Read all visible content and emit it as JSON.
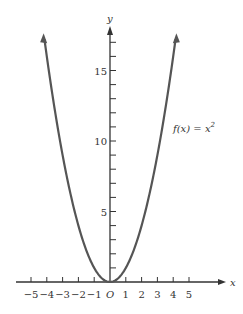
{
  "chart_data": {
    "type": "line",
    "title": "",
    "function_label": "f(x) = x^2",
    "xlabel": "x",
    "ylabel": "y",
    "origin_label": "O",
    "x_ticks": [
      -5,
      -4,
      -3,
      -2,
      -1,
      1,
      2,
      3,
      4,
      5
    ],
    "x_tick_labels": [
      "−5",
      "−4",
      "−3",
      "−2",
      "−1",
      "1",
      "2",
      "3",
      "4",
      "5"
    ],
    "y_tick_labels": [
      "5",
      "10",
      "15"
    ],
    "y_ticks": [
      5,
      10,
      15
    ],
    "xlim": [
      -5.5,
      6
    ],
    "ylim": [
      0,
      18
    ],
    "series": [
      {
        "name": "f(x) = x^2",
        "x": [
          -4.2,
          -4,
          -3,
          -2,
          -1,
          0,
          1,
          2,
          3,
          4,
          4.2
        ],
        "y": [
          17.64,
          16,
          9,
          4,
          1,
          0,
          1,
          4,
          9,
          16,
          17.64
        ]
      }
    ],
    "grid": false,
    "colors": {
      "curve": "#555555",
      "axis": "#333333"
    }
  }
}
